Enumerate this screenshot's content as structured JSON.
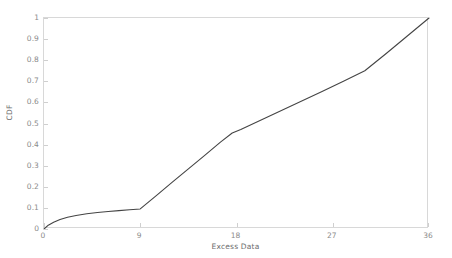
{
  "chart_data": {
    "type": "line",
    "title": "",
    "xlabel": "Excess Data",
    "ylabel": "CDF",
    "xlim": [
      0,
      36
    ],
    "ylim": [
      0,
      1
    ],
    "grid": false,
    "legend": null,
    "xticks": [
      "0",
      "9",
      "18",
      "27",
      "36"
    ],
    "xtick_values": [
      0,
      9,
      18,
      27,
      36
    ],
    "yticks": [
      "0",
      "0.1",
      "0.2",
      "0.3",
      "0.4",
      "0.5",
      "0.6",
      "0.7",
      "0.8",
      "0.9",
      "1"
    ],
    "ytick_values": [
      0,
      0.1,
      0.2,
      0.3,
      0.4,
      0.5,
      0.6,
      0.7,
      0.8,
      0.9,
      1
    ],
    "line_color": "#444444",
    "axis_color": "#d8d8d8",
    "tick_label_color": "#8a8a8a",
    "series": [
      {
        "name": "CDF of Excess Data",
        "x": [
          0,
          0.4,
          0.9,
          1.5,
          2.2,
          3.0,
          4.0,
          5.0,
          6.0,
          7.0,
          8.0,
          9.0,
          10.5,
          12.0,
          13.5,
          15.0,
          16.5,
          17.6,
          18.4,
          20.0,
          22.0,
          24.0,
          26.0,
          28.0,
          30.0,
          32.0,
          34.0,
          36.0
        ],
        "y": [
          0.0,
          0.018,
          0.032,
          0.045,
          0.056,
          0.064,
          0.072,
          0.078,
          0.083,
          0.087,
          0.091,
          0.095,
          0.158,
          0.222,
          0.285,
          0.348,
          0.412,
          0.455,
          0.472,
          0.51,
          0.557,
          0.604,
          0.652,
          0.7,
          0.75,
          0.832,
          0.916,
          1.0
        ]
      }
    ]
  },
  "axes": {
    "ylabel_text": "CDF",
    "xlabel_text": "Excess Data"
  }
}
